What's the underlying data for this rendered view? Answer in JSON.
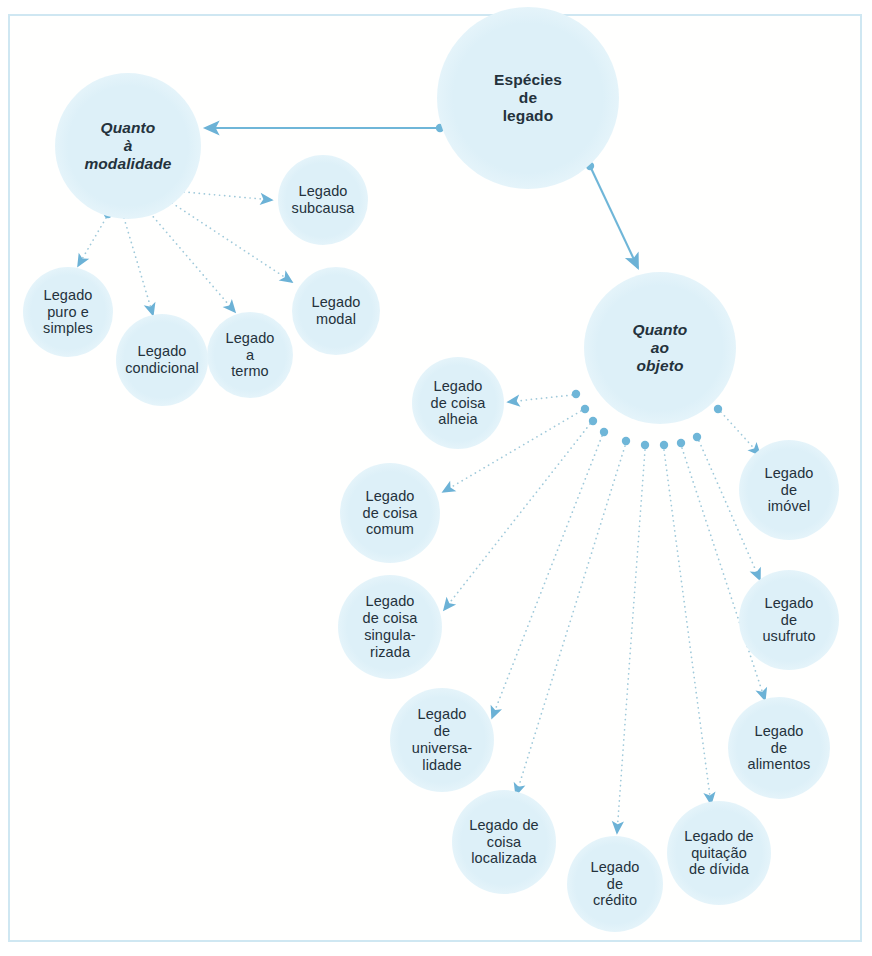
{
  "diagram": {
    "title_text": "Espécies de legado",
    "palette": {
      "node_fill": "#dff1f8",
      "edge_solid": "#6fb6d8",
      "edge_dotted": "#9fc9da",
      "arrow": "#6cb2d6",
      "frame_border": "#cfe7f2",
      "text": "#24323c",
      "background": "#ffffff"
    },
    "nodes": [
      {
        "id": "root",
        "label": "Espécies\nde\nlegado",
        "kind": "root",
        "cx": 528,
        "cy": 98,
        "r": 91
      },
      {
        "id": "modalidade",
        "label": "Quanto\nà\nmodalidade",
        "kind": "branch",
        "cx": 128,
        "cy": 146,
        "r": 73
      },
      {
        "id": "objeto",
        "label": "Quanto\nao\nobjeto",
        "kind": "branch",
        "cx": 660,
        "cy": 348,
        "r": 76
      },
      {
        "id": "subcausa",
        "label": "Legado\nsubcausa",
        "kind": "leaf",
        "cx": 323,
        "cy": 200,
        "r": 45
      },
      {
        "id": "puro",
        "label": "Legado\npuro e\nsimples",
        "kind": "leaf",
        "cx": 68,
        "cy": 312,
        "r": 45
      },
      {
        "id": "modal",
        "label": "Legado\nmodal",
        "kind": "leaf",
        "cx": 336,
        "cy": 311,
        "r": 44
      },
      {
        "id": "condicional",
        "label": "Legado\ncondicional",
        "kind": "leaf",
        "cx": 162,
        "cy": 360,
        "r": 46
      },
      {
        "id": "termo",
        "label": "Legado\na\ntermo",
        "kind": "leaf",
        "cx": 250,
        "cy": 355,
        "r": 43
      },
      {
        "id": "alheia",
        "label": "Legado\nde coisa\nalheia",
        "kind": "leaf",
        "cx": 458,
        "cy": 403,
        "r": 46
      },
      {
        "id": "imovel",
        "label": "Legado\nde\nimóvel",
        "cx": 789,
        "cy": 490,
        "r": 50,
        "kind": "leaf"
      },
      {
        "id": "comum",
        "label": "Legado\nde coisa\ncomum",
        "kind": "leaf",
        "cx": 390,
        "cy": 513,
        "r": 50
      },
      {
        "id": "singular",
        "label": "Legado\nde coisa\nsingula-\nrizada",
        "kind": "leaf",
        "cx": 390,
        "cy": 627,
        "r": 52
      },
      {
        "id": "usufruto",
        "label": "Legado\nde\nusufruto",
        "kind": "leaf",
        "cx": 789,
        "cy": 620,
        "r": 50
      },
      {
        "id": "universal",
        "label": "Legado\nde\nuniversa-\nlidade",
        "kind": "leaf",
        "cx": 442,
        "cy": 740,
        "r": 52
      },
      {
        "id": "alimentos",
        "label": "Legado\nde\nalimentos",
        "kind": "leaf",
        "cx": 779,
        "cy": 748,
        "r": 51
      },
      {
        "id": "localizada",
        "label": "Legado de\ncoisa\nlocalizada",
        "kind": "leaf",
        "cx": 504,
        "cy": 842,
        "r": 52
      },
      {
        "id": "quitacao",
        "label": "Legado de\nquitação\nde dívida",
        "kind": "leaf",
        "cx": 719,
        "cy": 853,
        "r": 52
      },
      {
        "id": "credito",
        "label": "Legado\nde\ncrédito",
        "kind": "leaf",
        "cx": 615,
        "cy": 884,
        "r": 48
      }
    ],
    "edges_solid": [
      {
        "from": "root",
        "to": "modalidade",
        "dot_x": 440,
        "dot_y": 128,
        "x1": 440,
        "y1": 128,
        "x2": 205,
        "y2": 128
      },
      {
        "from": "root",
        "to": "objeto",
        "dot_x": 590,
        "dot_y": 166,
        "x1": 590,
        "y1": 166,
        "x2": 638,
        "y2": 268
      }
    ],
    "edges_dotted": [
      {
        "from": "modalidade",
        "to": "subcausa",
        "dot_x": 178,
        "dot_y": 191,
        "x1": 184,
        "y1": 192,
        "x2": 272,
        "y2": 200
      },
      {
        "from": "modalidade",
        "to": "modal",
        "dot_x": 166,
        "dot_y": 200,
        "x1": 172,
        "y1": 203,
        "x2": 292,
        "y2": 282
      },
      {
        "from": "modalidade",
        "to": "puro",
        "dot_x": 108,
        "dot_y": 214,
        "x1": 106,
        "y1": 218,
        "x2": 78,
        "y2": 266
      },
      {
        "from": "modalidade",
        "to": "condicional",
        "dot_x": 124,
        "dot_y": 214,
        "x1": 124,
        "y1": 218,
        "x2": 153,
        "y2": 315
      },
      {
        "from": "modalidade",
        "to": "termo",
        "dot_x": 149,
        "dot_y": 209,
        "x1": 150,
        "y1": 213,
        "x2": 235,
        "y2": 312
      },
      {
        "from": "objeto",
        "to": "alheia",
        "dot_x": 576,
        "dot_y": 394,
        "x1": 572,
        "y1": 395,
        "x2": 508,
        "y2": 402
      },
      {
        "from": "objeto",
        "to": "comum",
        "dot_x": 585,
        "dot_y": 409,
        "x1": 581,
        "y1": 411,
        "x2": 443,
        "y2": 492
      },
      {
        "from": "objeto",
        "to": "singular",
        "dot_x": 593,
        "dot_y": 421,
        "x1": 590,
        "y1": 424,
        "x2": 444,
        "y2": 610
      },
      {
        "from": "objeto",
        "to": "universal",
        "dot_x": 604,
        "dot_y": 432,
        "x1": 602,
        "y1": 436,
        "x2": 492,
        "y2": 718
      },
      {
        "from": "objeto",
        "to": "localizada",
        "dot_x": 626,
        "dot_y": 441,
        "x1": 625,
        "y1": 446,
        "x2": 516,
        "y2": 795
      },
      {
        "from": "objeto",
        "to": "credito",
        "dot_x": 645,
        "dot_y": 445,
        "x1": 645,
        "y1": 450,
        "x2": 617,
        "y2": 833
      },
      {
        "from": "objeto",
        "to": "quitacao",
        "dot_x": 664,
        "dot_y": 445,
        "x1": 664,
        "y1": 450,
        "x2": 711,
        "y2": 804
      },
      {
        "from": "objeto",
        "to": "alimentos",
        "dot_x": 681,
        "dot_y": 443,
        "x1": 682,
        "y1": 448,
        "x2": 765,
        "y2": 700
      },
      {
        "from": "objeto",
        "to": "usufruto",
        "dot_x": 697,
        "dot_y": 437,
        "x1": 699,
        "y1": 441,
        "x2": 760,
        "y2": 580
      },
      {
        "from": "objeto",
        "to": "imovel",
        "dot_x": 718,
        "dot_y": 409,
        "x1": 721,
        "y1": 412,
        "x2": 760,
        "y2": 455
      }
    ]
  }
}
